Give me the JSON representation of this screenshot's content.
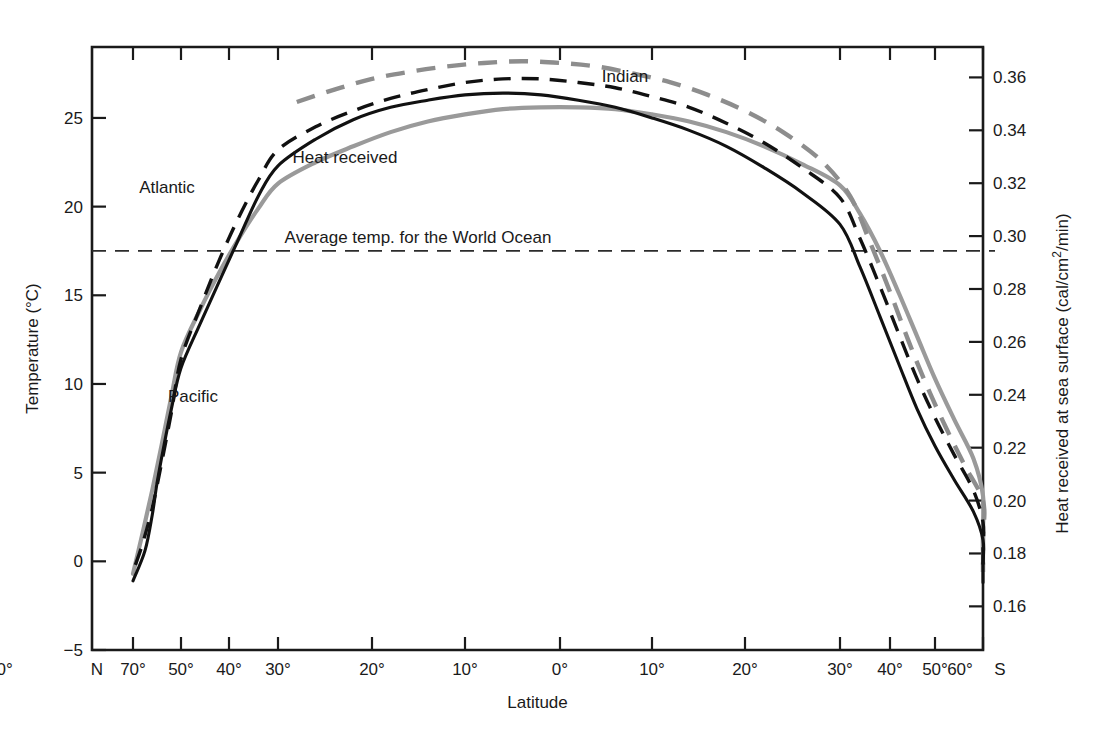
{
  "chart_data": {
    "type": "line",
    "title": "",
    "xlabel": "Latitude",
    "ylabel": "Temperature  (°C)",
    "y2label": "Heat received at sea surface  (cal/cm2/min)",
    "y2label_parts": {
      "pre": "Heat received at sea surface  (cal/cm",
      "sup": "2",
      "post": "/min)"
    },
    "grid": false,
    "legend_position": "inline-annotations",
    "ylim": [
      -5,
      29
    ],
    "y2lim": [
      0.1435,
      0.3715
    ],
    "yticks": [
      -5,
      0,
      5,
      10,
      15,
      20,
      25
    ],
    "yticklabels": [
      "−5",
      "0",
      "5",
      "10",
      "15",
      "20",
      "25"
    ],
    "y2ticks": [
      0.16,
      0.18,
      0.2,
      0.22,
      0.24,
      0.26,
      0.28,
      0.3,
      0.32,
      0.34,
      0.36
    ],
    "y2ticklabels": [
      "0.16",
      "0.18",
      "0.20",
      "0.22",
      "0.24",
      "0.26",
      "0.28",
      "0.30",
      "0.32",
      "0.34",
      "0.36"
    ],
    "x_hemisphere_left": "N",
    "x_hemisphere_right": "S",
    "xticklabels": [
      "70°",
      "50°",
      "40°",
      "30°",
      "20°",
      "10°",
      "0°",
      "10°",
      "20°",
      "30°",
      "40°",
      "50°",
      "60°",
      "70°"
    ],
    "xtick_px": [
      133,
      181,
      229,
      278,
      372,
      465,
      560,
      652,
      745,
      840,
      890,
      935,
      983
    ],
    "xticklabel_px": [
      133,
      181,
      229,
      278,
      372,
      465,
      560,
      652,
      745,
      840,
      890,
      935,
      960
    ],
    "annotations": [
      {
        "text": "Indian",
        "x": 625,
        "y": 82
      },
      {
        "text": "Heat received",
        "x": 345,
        "y": 163
      },
      {
        "text": "Atlantic",
        "x": 167,
        "y": 193
      },
      {
        "text": "Average temp. for the World Ocean",
        "x": 418,
        "y": 243
      },
      {
        "text": "Pacific",
        "x": 193,
        "y": 402
      }
    ],
    "average_temp_world_ocean": 17.5,
    "series": [
      {
        "name": "Atlantic",
        "style": "solid-black",
        "axis": "left",
        "unit": "°C",
        "points": [
          [
            -70,
            -1.1
          ],
          [
            -65,
            0.6
          ],
          [
            -62,
            2.6
          ],
          [
            -60,
            4.4
          ],
          [
            -57,
            6.6
          ],
          [
            -54,
            8.6
          ],
          [
            -50,
            10.9
          ],
          [
            -46,
            13.4
          ],
          [
            -42,
            15.8
          ],
          [
            -38,
            18.2
          ],
          [
            -34,
            20.6
          ],
          [
            -30,
            22.3
          ],
          [
            -26,
            23.8
          ],
          [
            -22,
            24.9
          ],
          [
            -18,
            25.6
          ],
          [
            -14,
            26.0
          ],
          [
            -10,
            26.3
          ],
          [
            -6,
            26.4
          ],
          [
            -2,
            26.3
          ],
          [
            2,
            26.0
          ],
          [
            6,
            25.6
          ],
          [
            10,
            25.0
          ],
          [
            14,
            24.3
          ],
          [
            18,
            23.4
          ],
          [
            22,
            22.2
          ],
          [
            26,
            20.8
          ],
          [
            30,
            19.0
          ],
          [
            34,
            16.6
          ],
          [
            38,
            13.8
          ],
          [
            42,
            11.1
          ],
          [
            46,
            8.6
          ],
          [
            50,
            6.5
          ],
          [
            54,
            4.6
          ],
          [
            58,
            2.8
          ],
          [
            62,
            1.2
          ],
          [
            66,
            -0.2
          ],
          [
            70,
            -1.2
          ]
        ]
      },
      {
        "name": "Pacific",
        "style": "dashed-black",
        "axis": "left",
        "unit": "°C",
        "points": [
          [
            -69,
            -0.2
          ],
          [
            -66,
            1.0
          ],
          [
            -62,
            3.0
          ],
          [
            -58,
            5.6
          ],
          [
            -54,
            8.4
          ],
          [
            -50,
            11.4
          ],
          [
            -46,
            14.3
          ],
          [
            -42,
            17.0
          ],
          [
            -38,
            19.4
          ],
          [
            -34,
            21.5
          ],
          [
            -30,
            23.2
          ],
          [
            -26,
            24.5
          ],
          [
            -22,
            25.4
          ],
          [
            -18,
            26.1
          ],
          [
            -14,
            26.6
          ],
          [
            -10,
            27.0
          ],
          [
            -6,
            27.2
          ],
          [
            -2,
            27.2
          ],
          [
            2,
            27.0
          ],
          [
            6,
            26.7
          ],
          [
            10,
            26.2
          ],
          [
            14,
            25.6
          ],
          [
            18,
            24.7
          ],
          [
            22,
            23.6
          ],
          [
            26,
            22.2
          ],
          [
            30,
            20.5
          ],
          [
            34,
            18.2
          ],
          [
            38,
            15.5
          ],
          [
            42,
            12.8
          ],
          [
            46,
            10.3
          ],
          [
            50,
            8.1
          ],
          [
            54,
            6.0
          ],
          [
            58,
            4.0
          ],
          [
            62,
            2.2
          ],
          [
            66,
            0.7
          ],
          [
            70,
            -0.5
          ]
        ]
      },
      {
        "name": "Indian",
        "style": "dashed-gray",
        "axis": "left",
        "unit": "°C",
        "points": [
          [
            -28,
            25.9
          ],
          [
            -24,
            26.6
          ],
          [
            -20,
            27.2
          ],
          [
            -16,
            27.6
          ],
          [
            -12,
            27.9
          ],
          [
            -8,
            28.1
          ],
          [
            -4,
            28.2
          ],
          [
            0,
            28.1
          ],
          [
            4,
            27.9
          ],
          [
            8,
            27.5
          ],
          [
            12,
            27.0
          ],
          [
            16,
            26.3
          ],
          [
            20,
            25.4
          ],
          [
            24,
            24.2
          ],
          [
            28,
            22.6
          ],
          [
            32,
            20.6
          ],
          [
            36,
            18.0
          ],
          [
            40,
            15.2
          ],
          [
            44,
            12.5
          ],
          [
            48,
            10.0
          ],
          [
            52,
            7.7
          ],
          [
            56,
            5.5
          ],
          [
            60,
            3.4
          ],
          [
            64,
            1.5
          ],
          [
            68,
            -0.1
          ],
          [
            70,
            -0.6
          ]
        ]
      },
      {
        "name": "Heat received",
        "style": "solid-gray",
        "axis": "right",
        "unit": "cal/cm2/min",
        "points_temp_equivalent": [
          [
            -70,
            -0.7
          ],
          [
            -66,
            1.6
          ],
          [
            -62,
            4.0
          ],
          [
            -58,
            6.6
          ],
          [
            -54,
            9.3
          ],
          [
            -50,
            11.8
          ],
          [
            -46,
            14.2
          ],
          [
            -42,
            16.3
          ],
          [
            -38,
            18.2
          ],
          [
            -34,
            19.9
          ],
          [
            -30,
            21.3
          ],
          [
            -26,
            22.5
          ],
          [
            -22,
            23.4
          ],
          [
            -18,
            24.2
          ],
          [
            -14,
            24.8
          ],
          [
            -10,
            25.2
          ],
          [
            -6,
            25.5
          ],
          [
            -2,
            25.6
          ],
          [
            2,
            25.6
          ],
          [
            6,
            25.5
          ],
          [
            10,
            25.2
          ],
          [
            14,
            24.8
          ],
          [
            18,
            24.2
          ],
          [
            22,
            23.4
          ],
          [
            26,
            22.4
          ],
          [
            30,
            21.2
          ],
          [
            34,
            19.6
          ],
          [
            38,
            17.5
          ],
          [
            42,
            15.1
          ],
          [
            46,
            12.7
          ],
          [
            50,
            10.3
          ],
          [
            54,
            8.0
          ],
          [
            58,
            5.8
          ],
          [
            62,
            3.7
          ],
          [
            66,
            1.7
          ],
          [
            70,
            -0.2
          ]
        ]
      }
    ]
  }
}
